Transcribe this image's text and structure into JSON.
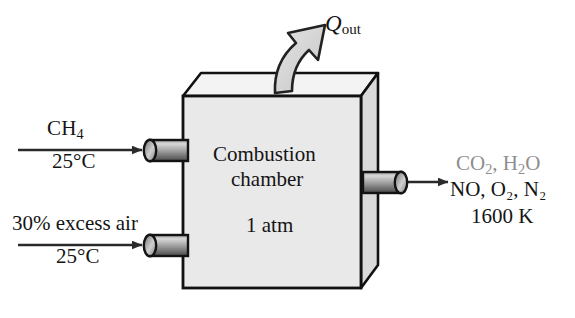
{
  "figure": {
    "background_color": "#ffffff"
  },
  "colors": {
    "outline": "#111111",
    "front_face": "#e9e9e9",
    "top_face": "#f4f4f4",
    "side_face": "#d8d8d8",
    "arrow_fill": "#d9d9d9",
    "pipe_dark": "#3a3a3a",
    "pipe_light": "#c9c9c9",
    "stream_arrow": "#2a2a2a",
    "faded_text": "#8e8e8e",
    "text": "#141414"
  },
  "heat_out": {
    "symbol": "Q",
    "subscript": "out",
    "arrow_name": "heat-out-curved-arrow"
  },
  "inlets": [
    {
      "id": "fuel",
      "label_above": "CH",
      "label_above_sub": "4",
      "label_below": "25°C",
      "pipe_name": "fuel-inlet-pipe",
      "arrow_name": "fuel-inlet-arrow"
    },
    {
      "id": "air",
      "label_above": "30% excess air",
      "label_above_sub": "",
      "label_below": "25°C",
      "pipe_name": "air-inlet-pipe",
      "arrow_name": "air-inlet-arrow"
    }
  ],
  "chamber": {
    "name_line_1": "Combustion",
    "name_line_2": "chamber",
    "pressure": "1 atm"
  },
  "outlet": {
    "pipe_name": "product-outlet-pipe",
    "arrow_name": "product-outlet-arrow",
    "products_line_1_parts": [
      "CO",
      "2",
      ", H",
      "2",
      "O"
    ],
    "products_line_1": "CO₂, H₂O",
    "products_line_2": "NO, O₂, N₂",
    "temperature": "1600 K"
  }
}
